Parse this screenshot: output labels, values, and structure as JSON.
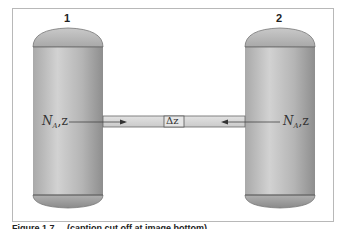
{
  "figure": {
    "vessels": [
      {
        "id": "1",
        "label": "1"
      },
      {
        "id": "2",
        "label": "2"
      }
    ],
    "left_flux_label": {
      "main": "N",
      "sub": "A",
      "suffix": ",z"
    },
    "right_flux_label": {
      "main": "N",
      "sub": "A",
      "suffix": ",z"
    },
    "tube_segment_label": "Δz",
    "caption_partial": "Figure 1.7 ... (caption cut off at image bottom)"
  },
  "colors": {
    "frame_border": "#b8b8b8",
    "vessel_fill_light": "#d0d0d0",
    "vessel_fill_dark": "#8a8a8a",
    "tube_fill": "#d8d8d8",
    "outline": "#555555"
  }
}
